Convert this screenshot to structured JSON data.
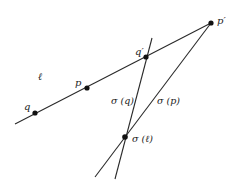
{
  "diagram": {
    "line_color": "#2a2a2a",
    "point_color": "#111111",
    "lines": [
      {
        "id": "line-l",
        "x1": 15,
        "y1": 124,
        "x2": 211,
        "y2": 23
      },
      {
        "id": "line-sigma-q",
        "x1": 152,
        "y1": 38,
        "x2": 115,
        "y2": 179
      },
      {
        "id": "line-sigma-p",
        "x1": 211,
        "y1": 23,
        "x2": 95,
        "y2": 177
      }
    ],
    "points": [
      {
        "id": "point-q",
        "cx": 35,
        "cy": 113
      },
      {
        "id": "point-p",
        "cx": 87,
        "cy": 88
      },
      {
        "id": "point-q-prime",
        "cx": 146,
        "cy": 57
      },
      {
        "id": "point-p-prime",
        "cx": 211,
        "cy": 23
      },
      {
        "id": "point-sigma-l",
        "cx": 125,
        "cy": 137
      }
    ],
    "labels": {
      "l": "ℓ",
      "p": "p",
      "q": "q",
      "q_prime": "q′",
      "p_prime": "p′",
      "sigma_q": "σ (q)",
      "sigma_p": "σ (p)",
      "sigma_l": "σ (ℓ)"
    }
  }
}
